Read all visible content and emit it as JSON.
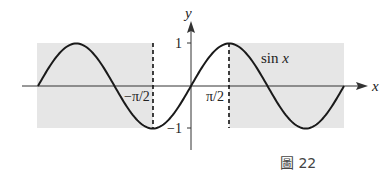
{
  "chart_data": {
    "type": "line",
    "title": "",
    "series": [
      {
        "name": "sin x",
        "function": "sin(x)",
        "x_range": [
          "-2π",
          "2π"
        ]
      }
    ],
    "xlabel": "x",
    "ylabel": "y",
    "x_ticks": [
      "−π/2",
      "π/2"
    ],
    "y_ticks": [
      "1",
      "−1"
    ],
    "annotations": [
      "sin x",
      "dashed vertical lines at x = −π/2 and x = π/2",
      "shaded regions x < −π/2 and x > π/2"
    ],
    "ylim": [
      -1,
      1
    ]
  },
  "labels": {
    "y_axis": "y",
    "x_axis": "x",
    "y_one": "1",
    "y_neg_one": "−1",
    "x_neg_half_pi": "−π/2",
    "x_half_pi": "π/2",
    "curve": "sin x"
  },
  "caption": "圖 22",
  "colors": {
    "shade": "#e6e6e6",
    "line": "#1a1a1a"
  }
}
